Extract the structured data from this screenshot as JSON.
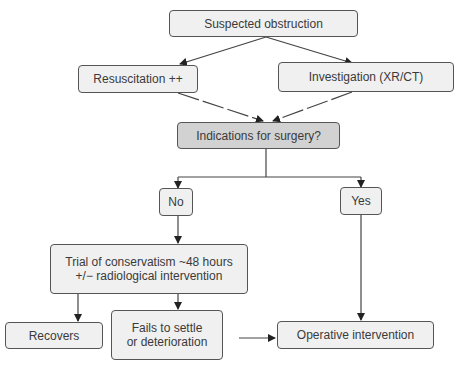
{
  "nodes": {
    "suspected": "Suspected obstruction",
    "resuscitation": "Resuscitation ++",
    "investigation": "Investigation (XR/CT)",
    "indications": "Indications for surgery?",
    "no": "No",
    "yes": "Yes",
    "trial_line1": "Trial of conservatism ~48 hours",
    "trial_line2": "+/− radiological intervention",
    "recovers": "Recovers",
    "fails_line1": "Fails to settle",
    "fails_line2": "or deterioration",
    "operative": "Operative intervention"
  },
  "colors": {
    "box_fill": "#f0f0f0",
    "decision_fill": "#d2d2d2",
    "stroke": "#555555"
  }
}
